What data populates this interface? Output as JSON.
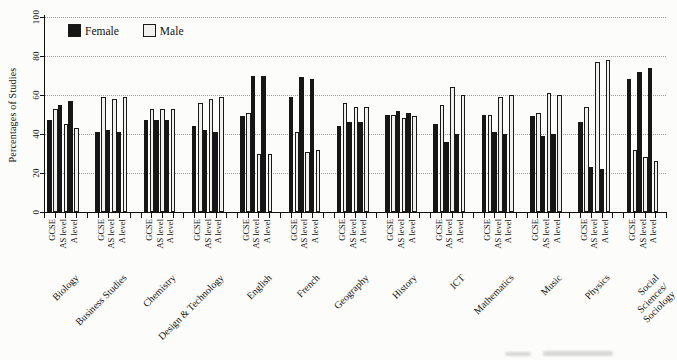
{
  "chart_data": {
    "type": "bar",
    "title": "",
    "ylabel": "Percentages of Studies",
    "ylim": [
      0,
      100
    ],
    "yticks": [
      0,
      20,
      40,
      60,
      80,
      100
    ],
    "grid": "horizontal-dotted",
    "legend": {
      "position": "top-left-inside",
      "entries": [
        {
          "name": "Female",
          "color": "#161616"
        },
        {
          "name": "Male",
          "color": "#f1f0ec"
        }
      ]
    },
    "group_axis_labels": [
      "GCSE",
      "AS level",
      "A level"
    ],
    "categories": [
      "Biology",
      "Business Studies",
      "Chemistry",
      "Design & Technology",
      "English",
      "French",
      "Geography",
      "History",
      "ICT",
      "Mathematics",
      "Music",
      "Physics",
      "Social Sciences/\nSociology"
    ],
    "series": [
      {
        "name": "Female",
        "color": "#161616",
        "values": [
          [
            47,
            55,
            57
          ],
          [
            41,
            42,
            41
          ],
          [
            47,
            47,
            47
          ],
          [
            44,
            42,
            41
          ],
          [
            49,
            70,
            70
          ],
          [
            59,
            69,
            68
          ],
          [
            44,
            46,
            46
          ],
          [
            50,
            52,
            51
          ],
          [
            45,
            36,
            40
          ],
          [
            50,
            41,
            40
          ],
          [
            49,
            39,
            40
          ],
          [
            46,
            23,
            22
          ],
          [
            68,
            72,
            74
          ]
        ]
      },
      {
        "name": "Male",
        "color": "#f1f0ec",
        "values": [
          [
            53,
            45,
            43
          ],
          [
            59,
            58,
            59
          ],
          [
            53,
            53,
            53
          ],
          [
            56,
            58,
            59
          ],
          [
            51,
            30,
            30
          ],
          [
            41,
            31,
            32
          ],
          [
            56,
            54,
            54
          ],
          [
            50,
            48,
            49
          ],
          [
            55,
            64,
            60
          ],
          [
            50,
            59,
            60
          ],
          [
            51,
            61,
            60
          ],
          [
            54,
            77,
            78
          ],
          [
            32,
            28,
            26
          ]
        ]
      }
    ]
  }
}
